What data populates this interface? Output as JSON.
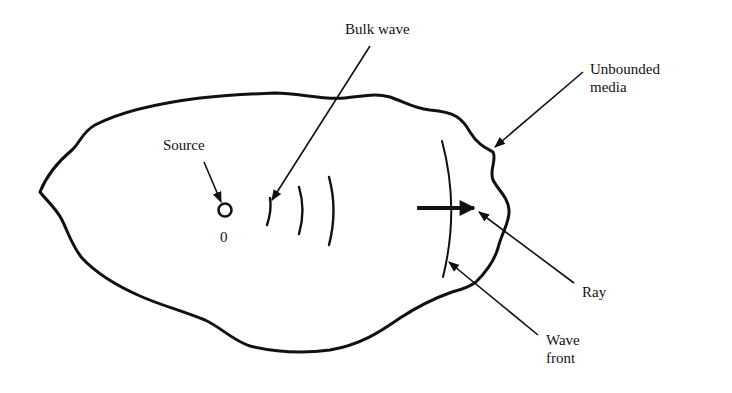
{
  "diagram": {
    "labels": {
      "bulk_wave": "Bulk wave",
      "source": "Source",
      "origin": "0",
      "unbounded_line1": "Unbounded",
      "unbounded_line2": "media",
      "ray": "Ray",
      "wave_front_line1": "Wave",
      "wave_front_line2": "front"
    },
    "colors": {
      "stroke": "#111111",
      "background": "#ffffff"
    },
    "elements": {
      "medium_boundary": "irregular closed outline",
      "source_point": "small circle at origin 0",
      "wavefronts": [
        "arc-1",
        "arc-2",
        "arc-3",
        "wave-front-arc"
      ],
      "ray_arrow": "thick arrow pointing right"
    }
  }
}
